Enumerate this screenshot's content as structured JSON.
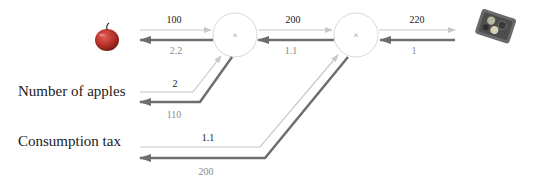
{
  "diagram": {
    "inputs": {
      "apple": {
        "icon": "apple-icon"
      },
      "number_of_apples": {
        "label": "Number of apples"
      },
      "consumption_tax": {
        "label": "Consumption tax"
      }
    },
    "output": {
      "icon": "tray-icon"
    },
    "nodes": [
      {
        "id": "mul1",
        "op": "×"
      },
      {
        "id": "mul2",
        "op": "×"
      }
    ],
    "edges": {
      "apple_to_mul1": {
        "forward": "100",
        "backward": "2.2"
      },
      "count_to_mul1": {
        "forward": "2",
        "backward": "110"
      },
      "mul1_to_mul2": {
        "forward": "200",
        "backward": "1.1"
      },
      "tax_to_mul2": {
        "forward": "1.1",
        "backward": "200"
      },
      "mul2_to_output": {
        "forward": "220",
        "backward": "1"
      }
    },
    "colors": {
      "forward_line": "#c8c8c8",
      "backward_line": "#6e6e6e",
      "node_stroke": "#d8d8d8",
      "apple": "#c0392b",
      "tray": "#5a5a5a"
    }
  }
}
